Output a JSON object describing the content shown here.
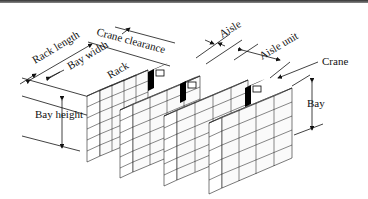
{
  "diagram": {
    "labels": {
      "rack_length": "Rack length",
      "bay_width": "Bay width",
      "crane_clearance": "Crane clearance",
      "rack": "Rack",
      "aisle": "Aisle",
      "aisle_unit": "Aisle unit",
      "crane": "Crane",
      "bay_height": "Bay height",
      "bay": "Bay"
    },
    "racks": [
      {
        "name": "rack-1",
        "cols": 3,
        "rows": 6
      },
      {
        "name": "rack-2",
        "cols": 3,
        "rows": 6
      },
      {
        "name": "rack-3",
        "cols": 3,
        "rows": 6
      },
      {
        "name": "rack-4",
        "cols": 3,
        "rows": 6
      }
    ],
    "cranes": 3,
    "colors": {
      "line": "#111111",
      "crane": "#000000",
      "background": "#ffffff"
    }
  }
}
